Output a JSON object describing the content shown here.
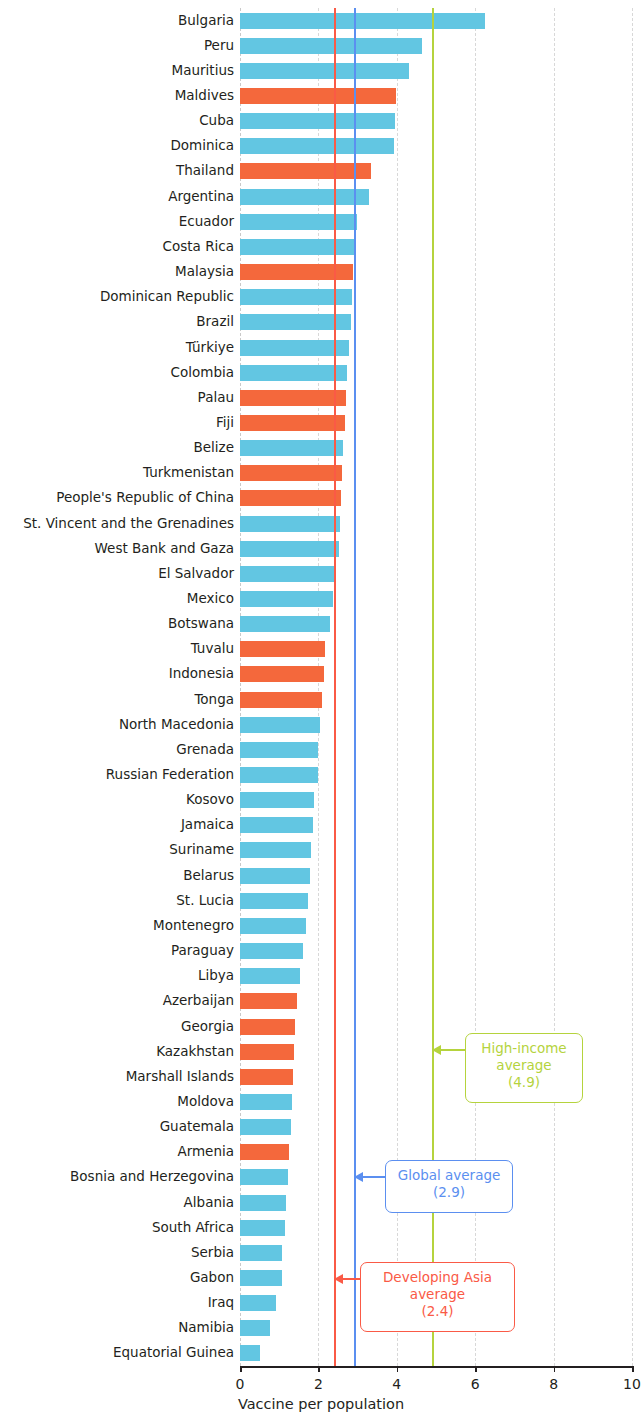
{
  "chart_data": {
    "type": "bar",
    "orientation": "horizontal",
    "title": "",
    "xlabel": "Vaccine per population",
    "ylabel": "",
    "xlim": [
      0,
      10
    ],
    "xticks": [
      0,
      2,
      4,
      6,
      8,
      10
    ],
    "xtick_labels": [
      "0",
      "2",
      "4",
      "6",
      "8",
      "10"
    ],
    "grid": true,
    "legend": "none",
    "categories": [
      "Bulgaria",
      "Peru",
      "Mauritius",
      "Maldives",
      "Cuba",
      "Dominica",
      "Thailand",
      "Argentina",
      "Ecuador",
      "Costa Rica",
      "Malaysia",
      "Dominican Republic",
      "Brazil",
      "Türkiye",
      "Colombia",
      "Palau",
      "Fiji",
      "Belize",
      "Turkmenistan",
      "People's Republic of China",
      "St. Vincent and the Grenadines",
      "West Bank and Gaza",
      "El Salvador",
      "Mexico",
      "Botswana",
      "Tuvalu",
      "Indonesia",
      "Tonga",
      "North Macedonia",
      "Grenada",
      "Russian Federation",
      "Kosovo",
      "Jamaica",
      "Suriname",
      "Belarus",
      "St. Lucia",
      "Montenegro",
      "Paraguay",
      "Libya",
      "Azerbaijan",
      "Georgia",
      "Kazakhstan",
      "Marshall Islands",
      "Moldova",
      "Guatemala",
      "Armenia",
      "Bosnia and Herzegovina",
      "Albania",
      "South Africa",
      "Serbia",
      "Gabon",
      "Iraq",
      "Namibia",
      "Equatorial Guinea"
    ],
    "values": [
      6.25,
      4.65,
      4.3,
      3.98,
      3.95,
      3.92,
      3.35,
      3.3,
      2.98,
      2.96,
      2.88,
      2.86,
      2.82,
      2.78,
      2.72,
      2.7,
      2.68,
      2.62,
      2.6,
      2.58,
      2.55,
      2.52,
      2.45,
      2.38,
      2.3,
      2.18,
      2.14,
      2.1,
      2.05,
      2.0,
      1.98,
      1.88,
      1.86,
      1.82,
      1.78,
      1.74,
      1.68,
      1.6,
      1.52,
      1.45,
      1.4,
      1.38,
      1.36,
      1.32,
      1.3,
      1.26,
      1.22,
      1.18,
      1.14,
      1.08,
      1.06,
      0.92,
      0.76,
      0.52
    ],
    "highlighted": [
      "Maldives",
      "Thailand",
      "Malaysia",
      "Palau",
      "Fiji",
      "Turkmenistan",
      "People's Republic of China",
      "Tuvalu",
      "Indonesia",
      "Tonga",
      "Azerbaijan",
      "Georgia",
      "Kazakhstan",
      "Marshall Islands",
      "Armenia"
    ],
    "colors": {
      "bar_default": "#62c6e2",
      "bar_highlight": "#f4683c",
      "grid": "#d8d8d8",
      "axis": "#231f20"
    },
    "reference_lines": [
      {
        "name": "high-income-average",
        "label": "High-income average",
        "value": 4.9,
        "value_label": "(4.9)",
        "color": "#b5d33d"
      },
      {
        "name": "global-average",
        "label": "Global average",
        "value": 2.9,
        "value_label": "(2.9)",
        "color": "#5b8ff0"
      },
      {
        "name": "developing-asia-average",
        "label": "Developing Asia average",
        "value": 2.4,
        "value_label": "(2.4)",
        "color": "#fa5a46"
      }
    ]
  }
}
